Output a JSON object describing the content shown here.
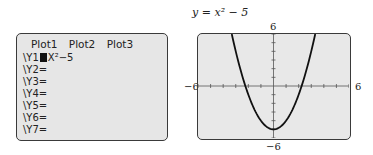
{
  "editor": {
    "plots": [
      "Plot1",
      "Plot2",
      "Plot3"
    ],
    "rows": [
      {
        "label": "\\Y1",
        "expr": "X²−5",
        "selected": true
      },
      {
        "label": "\\Y2=",
        "expr": ""
      },
      {
        "label": "\\Y3=",
        "expr": ""
      },
      {
        "label": "\\Y4=",
        "expr": ""
      },
      {
        "label": "\\Y5=",
        "expr": ""
      },
      {
        "label": "\\Y6=",
        "expr": ""
      },
      {
        "label": "\\Y7=",
        "expr": ""
      }
    ]
  },
  "graph": {
    "title": "y = x² − 5",
    "labels": {
      "ymax": "6",
      "ymin": "−6",
      "xmin": "−6",
      "xmax": "6"
    }
  },
  "chart_data": {
    "type": "line",
    "title": "y = x² − 5",
    "function": "y = x^2 - 5",
    "xlim": [
      -6,
      6
    ],
    "ylim": [
      -6,
      6
    ],
    "xscale": 1,
    "yscale": 1,
    "x": [
      -3.3,
      -3,
      -2.5,
      -2,
      -1.5,
      -1,
      -0.5,
      0,
      0.5,
      1,
      1.5,
      2,
      2.5,
      3,
      3.3
    ],
    "y": [
      5.89,
      4,
      1.25,
      -1,
      -2.75,
      -4,
      -4.75,
      -5,
      -4.75,
      -4,
      -2.75,
      -1,
      1.25,
      4,
      5.89
    ],
    "grid": false,
    "xlabel": "",
    "ylabel": ""
  }
}
